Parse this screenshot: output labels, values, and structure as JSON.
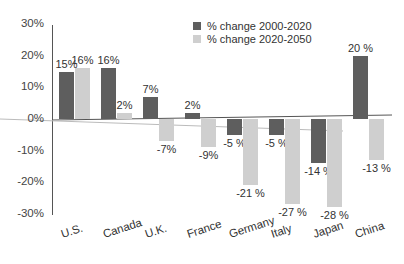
{
  "chart_data": {
    "type": "bar",
    "title": "",
    "xlabel": "",
    "ylabel": "",
    "ylim": [
      -30,
      30
    ],
    "yticks": [
      "30%",
      "20%",
      "10%",
      "0%",
      "-10%",
      "-20%",
      "-30%"
    ],
    "ytick_values": [
      30,
      20,
      10,
      0,
      -10,
      -20,
      -30
    ],
    "grid": false,
    "legend_position": "top-right",
    "categories": [
      "U.S.",
      "Canada",
      "U.K.",
      "France",
      "Germany",
      "Italy",
      "Japan",
      "China"
    ],
    "series": [
      {
        "name": "% change 2000-2020",
        "color": "#5e5e5e",
        "values": [
          15,
          16,
          7,
          2,
          -5,
          -5,
          -14,
          20
        ],
        "labels": [
          "15%",
          "16%",
          "7%",
          "2%",
          "-5 %",
          "-5 %",
          "-14 %",
          "20 %"
        ]
      },
      {
        "name": "% change 2020-2050",
        "color": "#cfcfcf",
        "values": [
          16,
          2,
          -7,
          -9,
          -21,
          -27,
          -28,
          -13
        ],
        "labels": [
          "16%",
          "2%",
          "-7%",
          "-9%",
          "-21 %",
          "-27 %",
          "-28 %",
          "-13 %"
        ]
      }
    ]
  }
}
